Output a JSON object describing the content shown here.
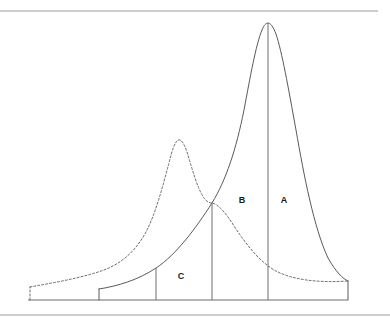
{
  "figure": {
    "background_color": "#ffffff",
    "width": 390,
    "height": 322
  },
  "frame": {
    "top_rule": {
      "name": "top-rule",
      "x1": 0,
      "y1": 11,
      "x2": 378,
      "y2": 11,
      "color": "#9a9a9a"
    },
    "bottom_rule": {
      "name": "bottom-rule",
      "x1": 0,
      "y1": 315,
      "x2": 390,
      "y2": 315,
      "color": "#9a9a9a"
    }
  },
  "axis": {
    "baseline": {
      "name": "baseline",
      "x1": 28,
      "y1": 300,
      "x2": 348,
      "y2": 300,
      "color": "#6e6e6e"
    }
  },
  "labels": [
    {
      "id": "A",
      "text": "A",
      "x": 284,
      "y": 201
    },
    {
      "id": "B",
      "text": "B",
      "x": 242,
      "y": 201
    },
    {
      "id": "C",
      "text": "C",
      "x": 181,
      "y": 277
    }
  ],
  "dividers": [
    {
      "name": "divider-c-left",
      "x": 156,
      "y_top": 262,
      "y_bottom": 300
    },
    {
      "name": "divider-crossing",
      "x": 212,
      "y_top": 203,
      "y_bottom": 300
    },
    {
      "name": "divider-peak",
      "x": 268,
      "y_top": 23,
      "y_bottom": 300
    }
  ],
  "curves": {
    "solid": {
      "name": "solid-distribution-curve",
      "style": "solid",
      "color": "#5a5a5a",
      "start": {
        "x": 99,
        "y": 300
      },
      "riser": {
        "x": 99,
        "y_top": 289,
        "y_bottom": 300
      },
      "peak": {
        "x": 268,
        "y": 23
      },
      "end": {
        "x": 348,
        "y": 281
      },
      "end_riser": {
        "x": 348,
        "y_top": 281,
        "y_bottom": 300
      },
      "path": "M 99 289 C 118 286, 138 280, 156 268 C 176 255, 196 228, 212 203 C 226 180, 236 150, 244 110 C 250 78, 256 44, 262 30 C 264 25, 266 23, 268 23 C 270 23, 273 26, 276 34 C 282 52, 288 86, 296 130 C 304 176, 314 228, 328 258 C 336 272, 343 279, 348 281"
    },
    "dashed": {
      "name": "dashed-distribution-curve",
      "style": "dashed",
      "color": "#6b6b6b",
      "start": {
        "x": 30,
        "y": 300
      },
      "riser": {
        "x": 30,
        "y_top": 287,
        "y_bottom": 300
      },
      "peak": {
        "x": 178,
        "y": 140
      },
      "end": {
        "x": 348,
        "y": 281
      },
      "path": "M 30 287 C 52 283, 76 279, 98 272 C 118 266, 134 254, 146 232 C 156 213, 163 185, 169 163 C 172 150, 175 142, 178 140 C 181 139, 184 143, 187 152 C 192 168, 197 188, 204 198 C 207 202, 210 203, 212 203 C 218 204, 226 213, 234 226 C 246 244, 258 260, 274 270 C 292 280, 318 283, 348 281"
    }
  },
  "regions": {
    "A": {
      "label": "A",
      "left_x": 268,
      "right_x": 348,
      "description": "right tail region of the solid curve"
    },
    "B": {
      "label": "B",
      "left_x": 212,
      "right_x": 268,
      "description": "region between curve crossing and solid peak"
    },
    "C": {
      "label": "C",
      "left_x": 156,
      "right_x": 212,
      "description": "region left of the curve crossing"
    }
  },
  "colors": {
    "solid_curve": "#5a5a5a",
    "dashed_curve": "#6b6b6b",
    "axis": "#6e6e6e",
    "frame_rule": "#9a9a9a",
    "label_text": "#1a1a1a",
    "background": "#ffffff"
  }
}
